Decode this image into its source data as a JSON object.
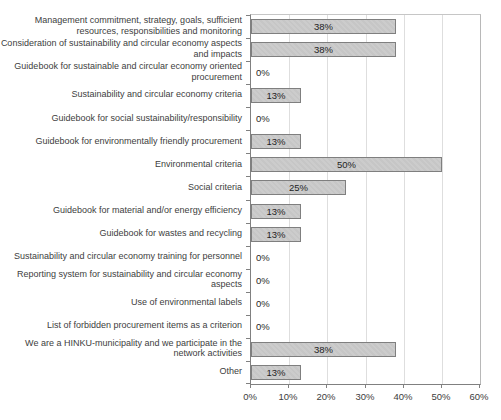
{
  "chart_data": {
    "type": "bar",
    "orientation": "horizontal",
    "title": "",
    "xlabel": "",
    "ylabel": "",
    "categories": [
      "Management commitment, strategy, goals, sufficient resources, responsibilities and monitoring",
      "Consideration of sustainability and circular economy aspects and impacts",
      "Guidebook for sustainable and circular economy oriented procurement",
      "Sustainability and circular economy criteria",
      "Guidebook for social sustainability/responsibility",
      "Guidebook for environmentally friendly procurement",
      "Environmental criteria",
      "Social criteria",
      "Guidebook for material and/or energy efficiency",
      "Guidebook for wastes and recycling",
      "Sustainability and circular economy training for personnel",
      "Reporting system for sustainability and circular economy aspects",
      "Use of environmental labels",
      "List of forbidden procurement items as a criterion",
      "We are a HINKU-municipality and we participate in the network activities",
      "Other"
    ],
    "values": [
      38,
      38,
      0,
      13,
      0,
      13,
      50,
      25,
      13,
      13,
      0,
      0,
      0,
      0,
      38,
      13
    ],
    "data_labels": [
      "38%",
      "38%",
      "0%",
      "13%",
      "0%",
      "13%",
      "50%",
      "25%",
      "13%",
      "13%",
      "0%",
      "0%",
      "0%",
      "0%",
      "38%",
      "13%"
    ],
    "xlim": [
      0,
      60
    ],
    "xtick_values": [
      0,
      10,
      20,
      30,
      40,
      50,
      60
    ],
    "xtick_labels": [
      "0%",
      "10%",
      "20%",
      "30%",
      "40%",
      "50%",
      "60%"
    ],
    "grid": true,
    "legend_position": "none",
    "colors": {
      "bar_fill": "#c9c9c9",
      "bar_border": "#7f7f7f",
      "gridline": "#dedede",
      "axis_line": "#808080",
      "plot_border": "#c0c0c0",
      "category_text": "#404040",
      "data_label_text": "#1f1f1f",
      "background": "#ffffff"
    }
  }
}
